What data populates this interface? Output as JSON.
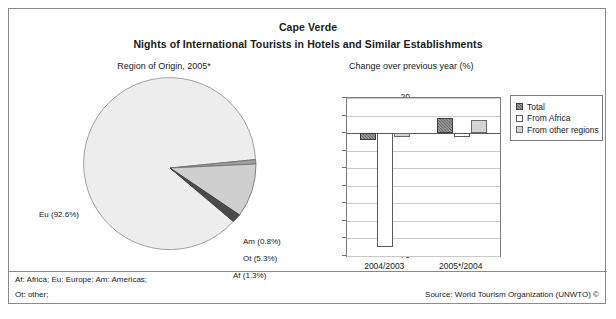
{
  "document": {
    "title_line1": "Cape Verde",
    "title_line2": "Nights of International Tourists in Hotels and Similar Establishments",
    "pie_subtitle": "Region of Origin, 2005*",
    "bar_subtitle": "Change over previous year (%)",
    "footnote_line1": "Af: Africa; Eu: Europe; Am: Americas;",
    "footnote_line2": "Ot: other;",
    "source": "Source: World Tourism Organization (UNWTO) ©"
  },
  "chart_data": [
    {
      "type": "pie",
      "title": "Region of Origin, 2005*",
      "categories": [
        "Eu",
        "Am",
        "Ot",
        "Af"
      ],
      "values": [
        92.6,
        0.8,
        5.3,
        1.3
      ],
      "labels": [
        "Eu (92.6%)",
        "Am (0.8%)",
        "Ot (5.3%)",
        "Af (1.3%)"
      ],
      "colors": [
        "#ededed",
        "#9e9e9e",
        "#cfcfcf",
        "#4a4a4a"
      ],
      "legend": "none",
      "units": "%"
    },
    {
      "type": "bar",
      "title": "Change over previous year (%)",
      "categories": [
        "2004/2003",
        "2005*/2004"
      ],
      "series": [
        {
          "name": "Total",
          "values": [
            -4.0,
            8.5
          ]
        },
        {
          "name": "From Africa",
          "values": [
            -65.0,
            -2.5
          ]
        },
        {
          "name": "From other regions",
          "values": [
            -2.0,
            7.5
          ]
        }
      ],
      "yticks": [
        20,
        10,
        0,
        -10,
        -20,
        -30,
        -40,
        -50,
        -60,
        -70
      ],
      "ylim": [
        -70,
        20
      ],
      "ylabel": "",
      "xlabel": "",
      "grid": true,
      "legend_position": "right",
      "series_colors": [
        "#6b6b6b",
        "#ffffff",
        "#d4d4d4"
      ]
    }
  ]
}
